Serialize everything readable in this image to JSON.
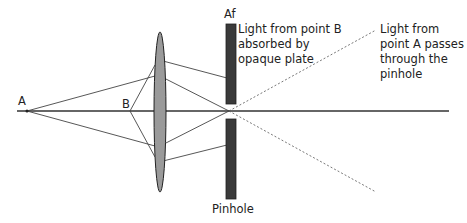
{
  "labels": {
    "point_a": "A",
    "point_b": "B",
    "aperture": "Af",
    "pinhole": "Pinhole",
    "note_b": [
      "Light from point B",
      "absorbed by",
      "opaque plate"
    ],
    "note_a": [
      "Light from",
      "point A passes",
      "through the",
      "pinhole"
    ]
  },
  "colors": {
    "lines": "#333333",
    "lens_fill": "#9a9a9a",
    "plate_fill": "#3a3a3a"
  }
}
